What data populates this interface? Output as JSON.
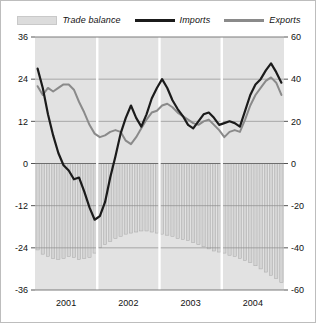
{
  "legend": {
    "items": [
      {
        "label": "Trade balance",
        "type": "area-swatch",
        "color": "#dcdcdc"
      },
      {
        "label": "Imports",
        "type": "line",
        "color": "#1b1b1b"
      },
      {
        "label": "Exports",
        "type": "line",
        "color": "#8a8a8a"
      }
    ]
  },
  "chart_data": {
    "type": "line",
    "title": "",
    "subtitle": "",
    "xlabel": "",
    "ylabel": "",
    "grid": true,
    "legend_position": "top-center",
    "plot_background": "#e2e2e2",
    "year_separator_color": "#ffffff",
    "left_axis": {
      "ticks": [
        "36",
        "24",
        "12",
        "0",
        "-12",
        "-24",
        "-36"
      ],
      "values": [
        36,
        24,
        12,
        0,
        -12,
        -24,
        -36
      ],
      "ylim": [
        -36,
        36
      ],
      "applies_to": [
        "Imports",
        "Exports"
      ]
    },
    "right_axis": {
      "ticks": [
        "60",
        "40",
        "20",
        "0",
        "-20",
        "-40",
        "-60"
      ],
      "values": [
        60,
        40,
        20,
        0,
        -20,
        -40,
        -60
      ],
      "ylim": [
        -60,
        60
      ],
      "applies_to": [
        "Trade balance"
      ]
    },
    "xtick_labels": [
      "2001",
      "2002",
      "2003",
      "2004"
    ],
    "x_year_boundaries": [
      2001,
      2002,
      2003,
      2004,
      2005
    ],
    "n_points": 48,
    "series": [
      {
        "name": "Imports",
        "color": "#1b1b1b",
        "axis": "left",
        "values": [
          27.0,
          21.5,
          14.0,
          8.0,
          3.0,
          -0.5,
          -2.0,
          -4.5,
          -4.0,
          -8.0,
          -12.5,
          -16.0,
          -15.0,
          -11.0,
          -4.0,
          2.0,
          8.5,
          13.0,
          16.5,
          13.0,
          10.5,
          14.0,
          18.5,
          21.5,
          24.0,
          21.5,
          18.0,
          15.5,
          13.5,
          11.0,
          10.0,
          12.0,
          14.0,
          14.5,
          13.0,
          11.0,
          11.5,
          12.0,
          11.5,
          10.5,
          15.0,
          19.5,
          22.5,
          24.0,
          26.5,
          28.5,
          26.0,
          23.0
        ]
      },
      {
        "name": "Exports",
        "color": "#8a8a8a",
        "axis": "left",
        "values": [
          22.0,
          19.5,
          21.5,
          20.5,
          21.5,
          22.5,
          22.5,
          21.0,
          17.5,
          14.5,
          11.0,
          8.5,
          7.5,
          8.0,
          9.0,
          9.5,
          9.0,
          6.5,
          5.5,
          7.5,
          10.0,
          12.5,
          14.5,
          15.0,
          16.5,
          17.0,
          16.0,
          14.5,
          13.5,
          12.5,
          11.5,
          11.0,
          12.0,
          12.5,
          11.0,
          9.5,
          7.5,
          9.0,
          9.5,
          9.0,
          12.5,
          16.5,
          19.5,
          21.5,
          23.5,
          24.5,
          23.0,
          19.5
        ]
      },
      {
        "name": "Trade balance",
        "color": "#c9c9c9",
        "axis": "right",
        "values": [
          -41.0,
          -43.0,
          -44.0,
          -45.0,
          -45.5,
          -45.0,
          -44.0,
          -44.5,
          -45.5,
          -45.0,
          -44.5,
          -42.5,
          -40.0,
          -38.5,
          -37.0,
          -35.5,
          -34.5,
          -33.5,
          -33.0,
          -32.5,
          -32.0,
          -32.0,
          -32.5,
          -33.0,
          -33.5,
          -34.0,
          -34.5,
          -35.5,
          -36.0,
          -36.5,
          -37.5,
          -38.5,
          -39.5,
          -40.5,
          -41.5,
          -42.0,
          -42.5,
          -43.5,
          -44.0,
          -45.0,
          -46.0,
          -47.0,
          -48.5,
          -50.0,
          -51.5,
          -53.0,
          -54.5,
          -56.5
        ]
      }
    ]
  }
}
